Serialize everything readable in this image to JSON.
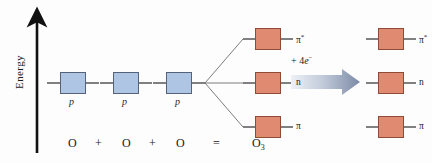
{
  "figure": {
    "background_color": "#fdfdfd",
    "axis": {
      "label": "Energy",
      "direction": "up"
    },
    "colors": {
      "atomic_orbital_fill": "#aec6e3",
      "atomic_orbital_stroke": "#54637a",
      "molecular_orbital_fill": "#e08a72",
      "molecular_orbital_stroke": "#8f4a38",
      "level_line": "#1a1a1a",
      "correlation_line": "#6d6d6d",
      "arrow_gradient_light": "#e9edf4",
      "arrow_gradient_dark": "#7b8aa6"
    },
    "atomic_orbitals": [
      {
        "label": "p",
        "x": 60,
        "y": 72,
        "occupancy": 0
      },
      {
        "label": "p",
        "x": 113,
        "y": 72,
        "occupancy": 0
      },
      {
        "label": "p",
        "x": 166,
        "y": 72,
        "occupancy": 0
      }
    ],
    "molecular_orbitals_left": [
      {
        "label": "π",
        "superscript": "*",
        "x": 255,
        "y": 28,
        "occupancy": 0
      },
      {
        "label": "n",
        "superscript": "",
        "x": 255,
        "y": 72,
        "occupancy": 0
      },
      {
        "label": "π",
        "superscript": "",
        "x": 255,
        "y": 116,
        "occupancy": 0
      }
    ],
    "molecular_orbitals_right": [
      {
        "label": "π",
        "superscript": "*",
        "x": 378,
        "y": 28,
        "occupancy": 0
      },
      {
        "label": "n",
        "superscript": "",
        "x": 378,
        "y": 72,
        "occupancy": 2
      },
      {
        "label": "π",
        "superscript": "",
        "x": 378,
        "y": 116,
        "occupancy": 2
      }
    ],
    "reaction_arrow": {
      "caption_prefix": "+ 4",
      "caption_species": "e",
      "caption_superscript": "−"
    },
    "equation": [
      {
        "text": "O",
        "sub": "",
        "x": 68
      },
      {
        "text": "+",
        "sub": "",
        "x": 95
      },
      {
        "text": "O",
        "sub": "",
        "x": 122
      },
      {
        "text": "+",
        "sub": "",
        "x": 149
      },
      {
        "text": "O",
        "sub": "",
        "x": 176
      },
      {
        "text": "=",
        "sub": "",
        "x": 213
      },
      {
        "text": "O",
        "sub": "3",
        "x": 252
      }
    ]
  }
}
